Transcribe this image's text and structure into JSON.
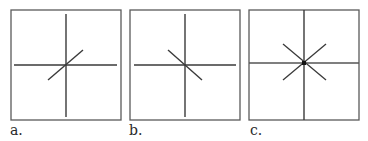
{
  "figure": {
    "colors": {
      "border": "#5a5a5a",
      "axis": "#3a3a3a",
      "diagonal": "#3a3a3a",
      "center_dot": "#111111",
      "background": "#ffffff"
    },
    "panels": [
      {
        "id": "a",
        "label": "a.",
        "description": "Cross with one diagonal rising left-to-right through center"
      },
      {
        "id": "b",
        "label": "b.",
        "description": "Cross with one diagonal falling left-to-right through center"
      },
      {
        "id": "c",
        "label": "c.",
        "description": "Cross with both diagonals through center, forming an eight-spoke star with center dot"
      }
    ]
  }
}
